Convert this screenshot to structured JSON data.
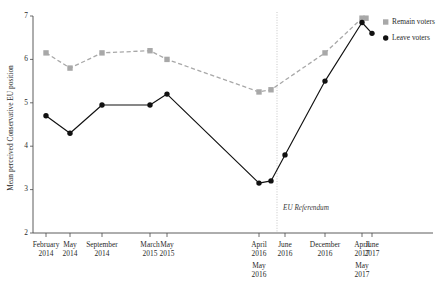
{
  "chart_data": {
    "type": "line",
    "title": "",
    "xlabel": "",
    "ylabel": "Mean perceived Conservative EU position",
    "ylim": [
      2,
      7
    ],
    "yticks": [
      2,
      3,
      4,
      5,
      6,
      7
    ],
    "grid": false,
    "legend_position": "right-top",
    "categories": [
      "February 2014",
      "May 2014",
      "September 2014",
      "March 2015",
      "May 2015",
      "April 2016",
      "May 2016",
      "June 2016",
      "December 2016",
      "April 2017",
      "May 2017",
      "June 2017"
    ],
    "xtick_labels": [
      {
        "line1": "February",
        "line2": "2014",
        "line3": "",
        "line4": ""
      },
      {
        "line1": "May",
        "line2": "2014",
        "line3": "",
        "line4": ""
      },
      {
        "line1": "September",
        "line2": "2014",
        "line3": "",
        "line4": ""
      },
      {
        "line1": "March",
        "line2": "2015",
        "line3": "",
        "line4": ""
      },
      {
        "line1": "May",
        "line2": "2015",
        "line3": "",
        "line4": ""
      },
      {
        "line1": "April",
        "line2": "2016",
        "line3": "May",
        "line4": "2016"
      },
      {
        "line1": "June",
        "line2": "2016",
        "line3": "",
        "line4": ""
      },
      {
        "line1": "December",
        "line2": "2016",
        "line3": "",
        "line4": ""
      },
      {
        "line1": "April",
        "line2": "2017",
        "line3": "May",
        "line4": "2017"
      },
      {
        "line1": "June",
        "line2": "2017",
        "line3": "",
        "line4": ""
      }
    ],
    "series": [
      {
        "name": "Remain voters",
        "color": "#a8a8a8",
        "marker": "square",
        "linestyle": "dashed",
        "points": [
          {
            "x": "February 2014",
            "y": 6.15
          },
          {
            "x": "May 2014",
            "y": 5.8
          },
          {
            "x": "September 2014",
            "y": 6.15
          },
          {
            "x": "March 2015",
            "y": 6.2
          },
          {
            "x": "May 2015",
            "y": 6.0
          },
          {
            "x": "April 2016",
            "y": 5.25
          },
          {
            "x": "May 2016",
            "y": 5.3
          },
          {
            "x": "December 2016",
            "y": 6.15
          },
          {
            "x": "April 2017",
            "y": 6.95
          },
          {
            "x": "May 2017",
            "y": 6.95
          }
        ]
      },
      {
        "name": "Leave voters",
        "color": "#111111",
        "marker": "circle",
        "linestyle": "solid",
        "points": [
          {
            "x": "February 2014",
            "y": 4.7
          },
          {
            "x": "May 2014",
            "y": 4.3
          },
          {
            "x": "September 2014",
            "y": 4.95
          },
          {
            "x": "March 2015",
            "y": 4.95
          },
          {
            "x": "May 2015",
            "y": 5.2
          },
          {
            "x": "April 2016",
            "y": 3.15
          },
          {
            "x": "May 2016",
            "y": 3.2
          },
          {
            "x": "June 2016",
            "y": 3.8
          },
          {
            "x": "December 2016",
            "y": 5.5
          },
          {
            "x": "April 2017",
            "y": 6.85
          },
          {
            "x": "June 2017",
            "y": 6.6
          }
        ]
      }
    ],
    "annotations": [
      {
        "name": "eu-referendum-line",
        "label": "EU Referendum",
        "style": "vertical-dotted"
      }
    ]
  },
  "legend": {
    "entries": [
      {
        "label": "Remain voters",
        "color": "#a8a8a8",
        "marker": "square"
      },
      {
        "label": "Leave voters",
        "color": "#111111",
        "marker": "circle"
      }
    ]
  }
}
